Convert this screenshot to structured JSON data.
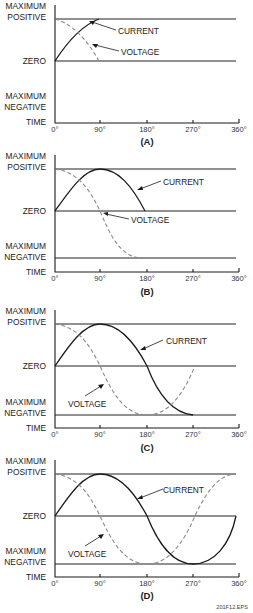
{
  "figure_id": "201F12.EPS",
  "y_labels": {
    "max_positive_line1": "MAXIMUM",
    "max_positive_line2": "POSITIVE",
    "zero": "ZERO",
    "max_negative_line1": "MAXIMUM",
    "max_negative_line2": "NEGATIVE",
    "time": "TIME"
  },
  "x_ticks": [
    "0°",
    "90°",
    "180°",
    "270°",
    "360°"
  ],
  "series_labels": {
    "current": "CURRENT",
    "voltage": "VOLTAGE"
  },
  "panels": [
    {
      "caption": "(A)",
      "description": "Current rises from zero toward maximum positive at 90°; voltage falls from maximum positive to zero at 90°",
      "extent_degrees": 90
    },
    {
      "caption": "(B)",
      "description": "Current peaks at 90° and returns to zero at 180°; voltage falls from maximum positive through zero at 90° to maximum negative at 180°",
      "extent_degrees": 180
    },
    {
      "caption": "(C)",
      "description": "Current reaches maximum negative at 270°; voltage returns from maximum negative at 180° to zero at 270°",
      "extent_degrees": 270
    },
    {
      "caption": "(D)",
      "description": "Full cycle: current is a sine wave, voltage leads current by 90° (cosine), returning to maximum positive at 360°",
      "extent_degrees": 360
    }
  ],
  "colors": {
    "current": "#1a1a1a",
    "voltage": "#8a8a8a",
    "lines": "#222222"
  }
}
